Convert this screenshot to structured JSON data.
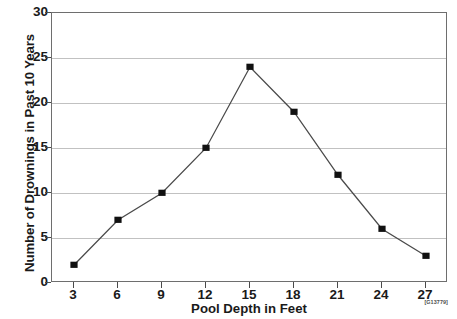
{
  "chart_data": {
    "type": "line",
    "title": "",
    "xlabel": "Pool Depth in Feet",
    "ylabel": "Number of Drownings in Past 10 Years",
    "x": [
      3,
      6,
      9,
      12,
      15,
      18,
      21,
      24,
      27
    ],
    "values": [
      2,
      7,
      10,
      15,
      24,
      19,
      12,
      6,
      3
    ],
    "series": [
      {
        "name": "Drownings",
        "values": [
          2,
          7,
          10,
          15,
          24,
          19,
          12,
          6,
          3
        ]
      }
    ],
    "xticks": [
      "3",
      "6",
      "9",
      "12",
      "15",
      "18",
      "21",
      "24",
      "27"
    ],
    "yticks": [
      "0",
      "5",
      "10",
      "15",
      "20",
      "25",
      "30"
    ],
    "ytick_values": [
      0,
      5,
      10,
      15,
      20,
      25,
      30
    ],
    "xlim": [
      1.5,
      28.5
    ],
    "ylim": [
      0,
      30
    ],
    "grid": "horizontal",
    "legend": "none",
    "marker": "filled-square",
    "line_color": "#4a4a4a",
    "marker_color": "#111111",
    "grid_color": "#a9a9a9",
    "frame_color": "#6e6e6e",
    "background_color": "#ffffff"
  },
  "annotations": {
    "figure_code": "[G13779]"
  }
}
